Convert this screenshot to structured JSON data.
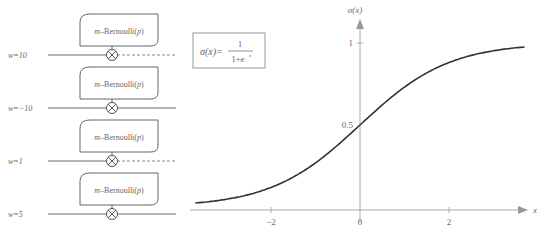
{
  "diagram": {
    "blocks": [
      {
        "label_italic": "m",
        "label_rest": "–Bernoulli(",
        "label_p": "p",
        "label_close": ")",
        "weight": "w=10",
        "dashed_output": true
      },
      {
        "label_italic": "m",
        "label_rest": "–Bernoulli(",
        "label_p": "p",
        "label_close": ")",
        "weight": "w=−10",
        "dashed_output": false
      },
      {
        "label_italic": "m",
        "label_rest": "–Bernoulli(",
        "label_p": "p",
        "label_close": ")",
        "weight": "w=1",
        "dashed_output": true
      },
      {
        "label_italic": "m",
        "label_rest": "–Bernoulli(",
        "label_p": "p",
        "label_close": ")",
        "weight": "w=5",
        "dashed_output": false
      }
    ],
    "multiply_icon": "circled-times",
    "formula": {
      "lhs": "σ(x)=",
      "numerator": "1",
      "denominator": "1+e",
      "exponent": "x"
    }
  },
  "chart_data": {
    "type": "line",
    "title": "",
    "xlabel": "x",
    "ylabel": "σ(x)",
    "x_ticks": [
      "−2",
      "0",
      "2"
    ],
    "y_ticks": [
      "0.5",
      "1"
    ],
    "xlim": [
      -3.7,
      3.7
    ],
    "ylim": [
      0,
      1
    ],
    "series": [
      {
        "name": "sigmoid",
        "function": "1/(1+e^-x)",
        "x": [
          -3.7,
          -3,
          -2,
          -1,
          0,
          1,
          2,
          3,
          3.7
        ],
        "values": [
          0.024,
          0.047,
          0.119,
          0.269,
          0.5,
          0.731,
          0.881,
          0.953,
          0.976
        ]
      }
    ],
    "grid": false,
    "legend": null
  }
}
